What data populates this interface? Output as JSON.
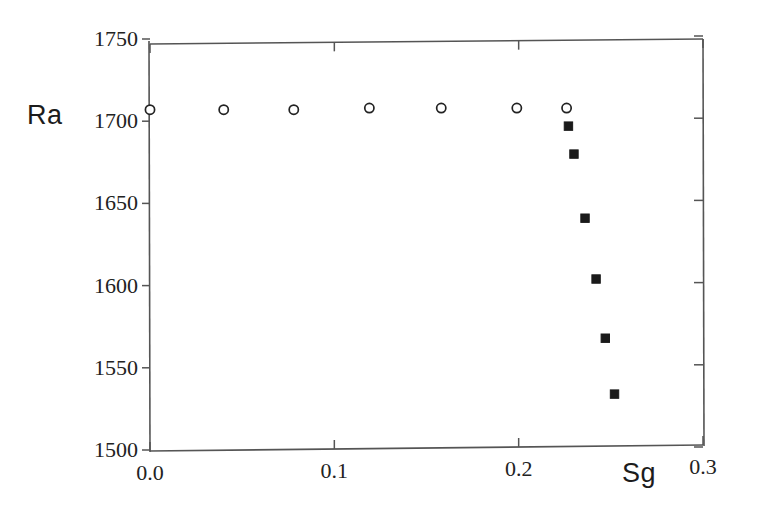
{
  "chart_data": {
    "type": "scatter",
    "title": "",
    "subtitle": "",
    "xlabel": "Sg",
    "ylabel": "Ra",
    "xlim": [
      0.0,
      0.3
    ],
    "ylim": [
      1500,
      1750
    ],
    "xticks": [
      "0.0",
      "0.1",
      "0.2",
      "0.3"
    ],
    "xtick_values": [
      0.0,
      0.1,
      0.2,
      0.3
    ],
    "yticks": [
      "1500",
      "1550",
      "1600",
      "1650",
      "1700",
      "1750"
    ],
    "ytick_values": [
      1500,
      1550,
      1600,
      1650,
      1700,
      1750
    ],
    "grid": false,
    "legend": null,
    "frame": "box",
    "tick_direction": "in",
    "series": [
      {
        "name": "open-circles",
        "marker": "open-circle",
        "color": "#222222",
        "points": [
          {
            "x": 0.0,
            "y": 1707
          },
          {
            "x": 0.04,
            "y": 1707
          },
          {
            "x": 0.078,
            "y": 1707
          },
          {
            "x": 0.119,
            "y": 1708
          },
          {
            "x": 0.158,
            "y": 1708
          },
          {
            "x": 0.199,
            "y": 1708
          },
          {
            "x": 0.226,
            "y": 1708
          }
        ]
      },
      {
        "name": "filled-squares",
        "marker": "filled-square",
        "color": "#1a1a1a",
        "points": [
          {
            "x": 0.227,
            "y": 1697
          },
          {
            "x": 0.23,
            "y": 1680
          },
          {
            "x": 0.236,
            "y": 1641
          },
          {
            "x": 0.242,
            "y": 1604
          },
          {
            "x": 0.247,
            "y": 1568
          },
          {
            "x": 0.252,
            "y": 1534
          }
        ]
      }
    ],
    "axis_color": "#555555"
  }
}
